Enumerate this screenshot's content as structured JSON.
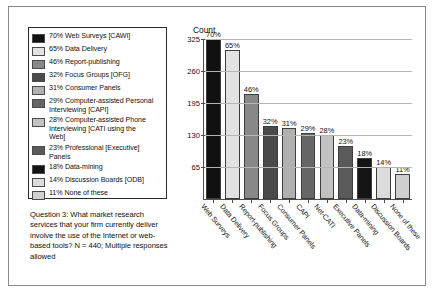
{
  "chart_data": {
    "type": "bar",
    "title": "Count",
    "xlabel": "",
    "ylabel": "Count",
    "ylim": [
      0,
      325
    ],
    "grid": true,
    "legend_position": "left-box",
    "ytick_labels": [
      "325",
      "260",
      "195",
      "130",
      "65"
    ],
    "ytick_values": [
      325,
      260,
      195,
      130,
      65
    ],
    "categories": [
      "Web Surveys",
      "Data Delivery",
      "Report-publishing",
      "Focus Groups",
      "Consumer Panels",
      "CAPI",
      "Net-CATI",
      "Executive Panels",
      "Data-mining",
      "Discussion Boards",
      "None of these"
    ],
    "values": [
      70,
      65,
      46,
      32,
      31,
      29,
      28,
      23,
      18,
      14,
      11
    ],
    "data_labels": [
      "70%",
      "65%",
      "46%",
      "32%",
      "31%",
      "29%",
      "28%",
      "23%",
      "18%",
      "14%",
      "11%"
    ],
    "bar_colors": [
      "#111111",
      "#e2e2e2",
      "#888888",
      "#4a4a4a",
      "#b0b0b0",
      "#666666",
      "#c2c2c2",
      "#5a5a5a",
      "#141414",
      "#dcdcdc",
      "#cfcfcf"
    ],
    "value_unit": "percent-of-respondents",
    "max_axis_count": 325,
    "n": 440
  },
  "legend": {
    "items": [
      {
        "label": "70% Web Surveys [CAWI]",
        "color": "#111111"
      },
      {
        "label": "65% Data Delivery",
        "color": "#e2e2e2"
      },
      {
        "label": "46% Report-publishing",
        "color": "#888888"
      },
      {
        "label": "32% Focus Groups [OFG]",
        "color": "#4a4a4a"
      },
      {
        "label": "31% Consumer Panels",
        "color": "#b0b0b0"
      },
      {
        "label": "29% Computer-assisted Personal\n         Interviewing [CAPI]",
        "color": "#666666"
      },
      {
        "label": "28% Computer-assisted Phone\n         Interviewing [CATI using the\n         Web]",
        "color": "#c2c2c2"
      },
      {
        "label": "23% Professional [Executive]\n         Panels",
        "color": "#5a5a5a"
      },
      {
        "label": "18% Data-mining",
        "color": "#141414"
      },
      {
        "label": "14% Discussion Boards [ODB]",
        "color": "#dcdcdc"
      },
      {
        "label": "11% None of these",
        "color": "#cfcfcf"
      }
    ]
  },
  "caption": {
    "text": "Question 3: What market research services that your firm currently deliver involve the use of the Internet or web-based tools? N = 440; Multiple responses allowed"
  }
}
